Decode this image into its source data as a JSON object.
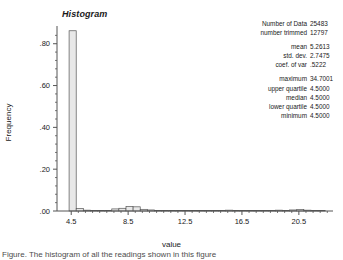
{
  "chart_data": {
    "type": "bar",
    "title": "Histogram",
    "xlabel": "value",
    "ylabel": "Frequency",
    "xlim": [
      3.5,
      22.9
    ],
    "ylim": [
      0.0,
      0.88
    ],
    "grid": false,
    "legend": null,
    "xticks": [
      "4.5",
      "8.5",
      "12.5",
      "16.5",
      "20.5"
    ],
    "xtick_values": [
      4.5,
      8.5,
      12.5,
      16.5,
      20.5
    ],
    "yticks": [
      ".00",
      ".20",
      ".40",
      ".60",
      ".80"
    ],
    "ytick_values": [
      0.0,
      0.2,
      0.4,
      0.6,
      0.8
    ],
    "bin_width": 0.5,
    "bin_left_edges": [
      4.35,
      4.85,
      5.35,
      5.85,
      6.35,
      6.85,
      7.35,
      7.85,
      8.35,
      8.85,
      9.35,
      9.85,
      10.35,
      10.85,
      11.35,
      11.85,
      12.35,
      12.85,
      13.35,
      13.85,
      14.35,
      14.85,
      15.35,
      15.85,
      16.35,
      16.85,
      17.35,
      17.85,
      18.35,
      18.85,
      19.35,
      19.85,
      20.35,
      20.85,
      21.35,
      21.85
    ],
    "values": [
      0.862,
      0.012,
      0.004,
      0.003,
      0.003,
      0.003,
      0.01,
      0.013,
      0.021,
      0.02,
      0.008,
      0.005,
      0.002,
      0.002,
      0.001,
      0.001,
      0.001,
      0.001,
      0.001,
      0.001,
      0.001,
      0.002,
      0.004,
      0.003,
      0.001,
      0.001,
      0.001,
      0.001,
      0.003,
      0.004,
      0.002,
      0.005,
      0.007,
      0.004,
      0.001,
      0.001
    ],
    "bar_fill": "#e8e8e8",
    "bar_edge": "#555555",
    "axis_color": "#555555"
  },
  "stats": {
    "rows": [
      {
        "label": "Number of Data",
        "value": "25483"
      },
      {
        "label": "number trimmed",
        "value": "12797"
      },
      {
        "label": "mean",
        "value": "5.2613"
      },
      {
        "label": "std. dev.",
        "value": "2.7475"
      },
      {
        "label": "coef. of var",
        "value": ".5222"
      },
      {
        "label": "maximum",
        "value": "34.7001"
      },
      {
        "label": "upper quartile",
        "value": "4.5000"
      },
      {
        "label": "median",
        "value": "4.5000"
      },
      {
        "label": "lower quartile",
        "value": "4.5000"
      },
      {
        "label": "minimum",
        "value": "4.5000"
      }
    ]
  },
  "caption": {
    "text": "Figure. The histogram of all the readings shown in this figure"
  }
}
